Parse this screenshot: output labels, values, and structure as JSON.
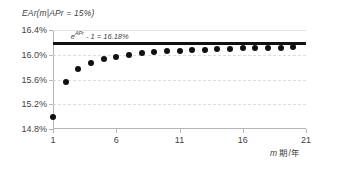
{
  "chart_data": {
    "type": "scatter",
    "title": "EAr(m|APr = 15%)",
    "xlabel": "m 期/年",
    "ylabel": "",
    "xlim": [
      1,
      21
    ],
    "ylim": [
      14.8,
      16.4
    ],
    "grid": true,
    "legend_position": "none",
    "x_ticks": [
      "1",
      "6",
      "11",
      "16",
      "21"
    ],
    "x_tick_values": [
      1,
      6,
      11,
      16,
      21
    ],
    "y_ticks": [
      "14.8%",
      "15.2%",
      "15.6%",
      "16.0%",
      "16.4%"
    ],
    "y_tick_values": [
      14.8,
      15.2,
      15.6,
      16.0,
      16.4
    ],
    "series": [
      {
        "name": "EAr(m)",
        "marker": "circle",
        "color": "#101010",
        "x": [
          1,
          2,
          3,
          4,
          5,
          6,
          7,
          8,
          9,
          10,
          11,
          12,
          13,
          14,
          15,
          16,
          17,
          18,
          19,
          20
        ],
        "values": [
          15.0,
          15.5625,
          15.7625,
          15.865,
          15.9274,
          15.9693,
          15.9995,
          16.0222,
          16.0399,
          16.0541,
          16.0657,
          16.0755,
          16.0837,
          16.0907,
          16.0968,
          16.1021,
          16.1068,
          16.111,
          16.1147,
          16.118
        ]
      }
    ],
    "annotations": [
      {
        "id": "asymptote-value",
        "text_prefix": "e",
        "text_superscript": "APr",
        "text_suffix": " - 1 = 16.18%",
        "value": 16.1834,
        "line": "horizontal-solid-black"
      }
    ]
  },
  "title": {
    "text": "EAr(m|APr = 15%)"
  },
  "axis": {
    "x_title_symbol": "m",
    "x_title_rest": " 期/年"
  },
  "colors": {
    "marker": "#101010",
    "asymptote": "#111111",
    "grid": "#dcdcdc",
    "axis": "#b4b4b4",
    "text": "#3f3f3f",
    "background": "#ffffff"
  }
}
